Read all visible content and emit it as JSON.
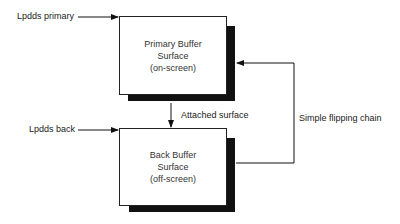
{
  "diagram": {
    "nodes": [
      {
        "id": "primary",
        "lines": [
          "Primary Buffer",
          "Surface",
          "(on-screen)"
        ]
      },
      {
        "id": "back",
        "lines": [
          "Back Buffer",
          "Surface",
          "(off-screen)"
        ]
      }
    ],
    "pointers": {
      "primary": "Lpdds primary",
      "back": "Lpdds back"
    },
    "edges": {
      "attached": "Attached surface",
      "flip_chain": "Simple flipping chain"
    }
  }
}
